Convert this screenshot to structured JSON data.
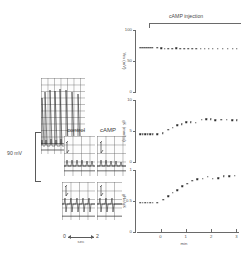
{
  "figure": {
    "scalebar_voltage": "90 mV",
    "trace_labels": {
      "control": "control",
      "camp": "cAMP"
    },
    "timebar": {
      "start": "0",
      "end": "2",
      "unit": "sec"
    }
  },
  "plots_header": {
    "label": "cAMP  injection"
  },
  "xaxis": {
    "label": "min",
    "ticks": [
      "0",
      "1",
      "2",
      "3"
    ],
    "tick_values": [
      0,
      1,
      2,
      3
    ],
    "range": [
      -0.85,
      3.1
    ]
  },
  "chart_data": [
    {
      "type": "scatter",
      "title": "cAMP injection",
      "panel": "top",
      "ylabel": "Vm (mV)",
      "xlabel": "min",
      "ylim": [
        0,
        100
      ],
      "yticks": [
        0,
        50,
        100
      ],
      "ytick_labels": [
        "0",
        "50",
        "100"
      ],
      "grid": false,
      "legend": "none",
      "annotation": "cAMP injection at t = 0",
      "x": [
        -0.8,
        -0.72,
        -0.64,
        -0.56,
        -0.48,
        -0.4,
        -0.32,
        -0.12,
        0.02,
        0.16,
        0.3,
        0.46,
        0.62,
        0.78,
        0.94,
        1.1,
        1.26,
        1.42,
        1.58,
        1.74,
        1.9,
        2.06,
        2.26,
        2.46,
        2.66,
        2.86,
        3.02
      ],
      "y": [
        71,
        71,
        71,
        71,
        71,
        71,
        71,
        71,
        70.5,
        70,
        70,
        70,
        70.5,
        70,
        70,
        69.5,
        70,
        70,
        69.5,
        70,
        69.5,
        69.5,
        70,
        69.5,
        70,
        70,
        70
      ]
    },
    {
      "type": "scatter",
      "panel": "middle",
      "ylabel": "gK (mmho)",
      "xlabel": "min",
      "ylim": [
        0,
        10
      ],
      "yticks": [
        0,
        5,
        10
      ],
      "ytick_labels": [
        "0",
        "5",
        "10"
      ],
      "grid": false,
      "legend": "none",
      "x": [
        -0.8,
        -0.7,
        -0.6,
        -0.5,
        -0.4,
        -0.3,
        -0.12,
        0.08,
        0.3,
        0.48,
        0.66,
        0.84,
        1.02,
        1.2,
        1.4,
        1.62,
        1.8,
        1.98,
        2.16,
        2.4,
        2.62,
        2.84,
        3.02
      ],
      "y": [
        4.5,
        4.5,
        4.5,
        4.5,
        4.5,
        4.5,
        4.5,
        4.6,
        5.2,
        5.5,
        5.9,
        6.1,
        6.4,
        6.4,
        6.3,
        6.8,
        6.9,
        6.9,
        6.7,
        6.8,
        6.8,
        6.7,
        6.7
      ]
    },
    {
      "type": "scatter",
      "panel": "bottom",
      "ylabel": "gNa/gK",
      "xlabel": "min",
      "ylim": [
        0,
        1
      ],
      "yticks": [
        0,
        0.5,
        1
      ],
      "ytick_labels": [
        "0",
        "0.5",
        "1"
      ],
      "grid": false,
      "legend": "none",
      "x": [
        -0.8,
        -0.7,
        -0.6,
        -0.5,
        -0.4,
        -0.3,
        -0.12,
        0.1,
        0.3,
        0.48,
        0.66,
        0.86,
        1.06,
        1.26,
        1.46,
        1.66,
        1.86,
        2.06,
        2.28,
        2.5,
        2.72,
        2.94
      ],
      "y": [
        0.47,
        0.47,
        0.47,
        0.47,
        0.47,
        0.47,
        0.47,
        0.52,
        0.58,
        0.63,
        0.67,
        0.74,
        0.78,
        0.83,
        0.85,
        0.86,
        0.89,
        0.86,
        0.87,
        0.9,
        0.9,
        0.91
      ]
    }
  ]
}
